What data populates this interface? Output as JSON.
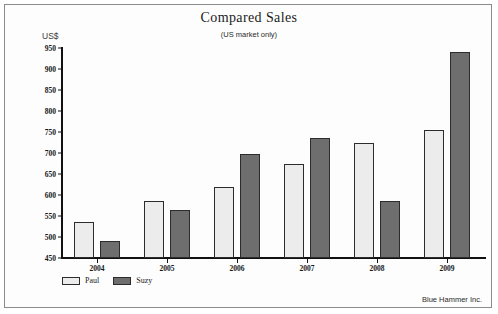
{
  "chart_data": {
    "type": "bar",
    "title": "Compared Sales",
    "subtitle": "(US market only)",
    "ylabel": "US$",
    "xlabel": "",
    "ylim": [
      450,
      950
    ],
    "yticks": [
      450,
      500,
      550,
      600,
      650,
      700,
      750,
      800,
      850,
      900,
      950
    ],
    "grid": false,
    "legend_position": "bottom-left",
    "categories": [
      "2004",
      "2005",
      "2006",
      "2007",
      "2008",
      "2009"
    ],
    "series": [
      {
        "name": "Paul",
        "color": "#ececec",
        "values": [
          535,
          585,
          620,
          675,
          725,
          755
        ]
      },
      {
        "name": "Suzy",
        "color": "#6e6e6e",
        "values": [
          490,
          565,
          698,
          735,
          585,
          940
        ]
      }
    ],
    "annotations": {
      "credit": "Blue Hammer Inc."
    }
  }
}
